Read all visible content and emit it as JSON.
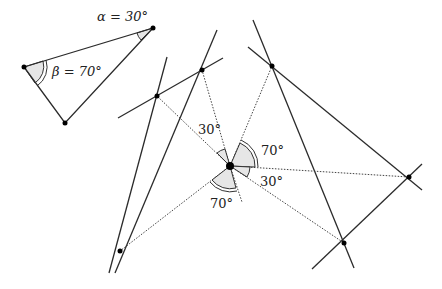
{
  "triangle": {
    "alpha_label": "α = 30°",
    "beta_label": "β = 70°",
    "alpha_deg": 30,
    "beta_deg": 70
  },
  "center_angles": {
    "upper_left_label": "30°",
    "upper_right_label": "70°",
    "right_label": "30°",
    "lower_label": "70°"
  }
}
